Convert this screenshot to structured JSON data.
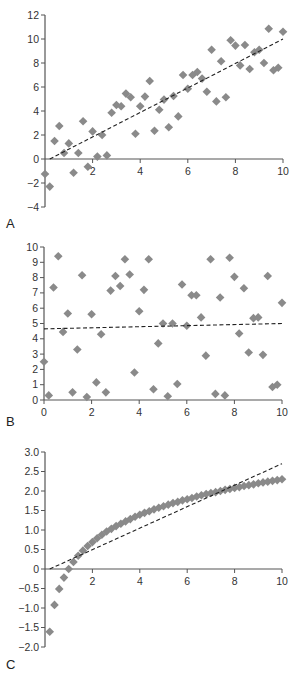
{
  "figure": {
    "marker_color": "#8a8a8a",
    "axis_color": "#555555",
    "fit_line_color": "#222222",
    "text_color": "#333333"
  },
  "chart_data": [
    {
      "panel": "A",
      "type": "scatter",
      "title": "",
      "xlabel": "",
      "ylabel": "",
      "xlim": [
        0,
        10
      ],
      "ylim": [
        -4,
        12
      ],
      "x_ticks": [
        2,
        4,
        6,
        8,
        10
      ],
      "y_ticks": [
        -4,
        -2,
        0,
        2,
        4,
        6,
        8,
        10,
        12
      ],
      "x_tick_labels": [
        "2",
        "4",
        "6",
        "8",
        "10"
      ],
      "y_tick_labels": [
        "-4",
        "-2",
        "0",
        "2",
        "4",
        "6",
        "8",
        "10",
        "12"
      ],
      "x_axis_at_y": 0,
      "grid": false,
      "legend": null,
      "marker": "diamond",
      "series": [
        {
          "name": "data",
          "x": [
            0,
            0.2,
            0.4,
            0.6,
            0.8,
            1,
            1.2,
            1.4,
            1.6,
            1.8,
            2,
            2.2,
            2.4,
            2.6,
            2.8,
            3,
            3.2,
            3.4,
            3.6,
            3.8,
            4,
            4.2,
            4.4,
            4.6,
            4.8,
            5,
            5.2,
            5.4,
            5.6,
            5.8,
            6,
            6.2,
            6.4,
            6.6,
            6.8,
            7,
            7.2,
            7.4,
            7.6,
            7.8,
            8,
            8.2,
            8.4,
            8.6,
            8.8,
            9,
            9.2,
            9.4,
            9.6,
            9.8,
            10
          ],
          "y": [
            -1.25,
            -2.3,
            1.5,
            2.75,
            0.5,
            1.3,
            -1.15,
            0.5,
            3.15,
            -0.65,
            2.3,
            0.2,
            2,
            0.3,
            3.85,
            4.5,
            4.4,
            5.45,
            5.15,
            2.1,
            4.4,
            5.2,
            6.5,
            2.35,
            4.1,
            4.95,
            2.65,
            5.25,
            3.55,
            7,
            5.85,
            7,
            7.25,
            6.7,
            5.6,
            9.1,
            4.8,
            8.15,
            5.15,
            9.9,
            9.45,
            7.8,
            9.5,
            7.5,
            8.9,
            9.1,
            8,
            10.85,
            7.4,
            7.6,
            10.6
          ]
        }
      ],
      "fit_line": {
        "style": "dashed",
        "x": [
          0.2,
          10
        ],
        "y": [
          0,
          10
        ]
      }
    },
    {
      "panel": "B",
      "type": "scatter",
      "title": "",
      "xlabel": "",
      "ylabel": "",
      "xlim": [
        0,
        10
      ],
      "ylim": [
        0,
        10
      ],
      "x_ticks": [
        0,
        2,
        4,
        6,
        8,
        10
      ],
      "y_ticks": [
        0,
        1,
        2,
        3,
        4,
        5,
        6,
        7,
        8,
        9,
        10
      ],
      "x_tick_labels": [
        "0",
        "2",
        "4",
        "6",
        "8",
        "10"
      ],
      "y_tick_labels": [
        "0",
        "1",
        "2",
        "3",
        "4",
        "5",
        "6",
        "7",
        "8",
        "9",
        "10"
      ],
      "x_axis_at_y": 0,
      "grid": false,
      "legend": null,
      "marker": "diamond",
      "series": [
        {
          "name": "data",
          "x": [
            0,
            0.2,
            0.4,
            0.6,
            0.8,
            1,
            1.2,
            1.4,
            1.6,
            1.8,
            2,
            2.2,
            2.4,
            2.6,
            2.8,
            3,
            3.2,
            3.4,
            3.6,
            3.8,
            4,
            4.2,
            4.4,
            4.6,
            4.8,
            5,
            5.2,
            5.4,
            5.6,
            5.8,
            6,
            6.2,
            6.4,
            6.6,
            6.8,
            7,
            7.2,
            7.4,
            7.6,
            7.8,
            8,
            8.2,
            8.4,
            8.6,
            8.8,
            9,
            9.2,
            9.4,
            9.6,
            9.8,
            10
          ],
          "y": [
            2.5,
            0.3,
            7.35,
            9.4,
            4.45,
            5.65,
            0.5,
            3.3,
            8.15,
            0.2,
            5.6,
            1.15,
            4.3,
            0.5,
            7.15,
            8.1,
            7.45,
            9.2,
            8.2,
            1.8,
            5.8,
            7.2,
            9.2,
            0.7,
            3.7,
            5,
            0.25,
            5,
            1.05,
            7.55,
            4.85,
            6.85,
            6.85,
            5.4,
            2.9,
            9.2,
            0.4,
            6.7,
            0.3,
            9.3,
            8.05,
            4.35,
            7.3,
            3.1,
            5.35,
            5.4,
            2.95,
            8.1,
            0.85,
            1,
            6.35
          ]
        }
      ],
      "fit_line": {
        "style": "dashed",
        "x": [
          0,
          10
        ],
        "y": [
          4.65,
          5.0
        ]
      }
    },
    {
      "panel": "C",
      "type": "scatter",
      "title": "",
      "xlabel": "",
      "ylabel": "",
      "xlim": [
        0,
        10
      ],
      "ylim": [
        -2.0,
        3.0
      ],
      "x_ticks": [
        2,
        4,
        6,
        8,
        10
      ],
      "y_ticks": [
        -2.0,
        -1.5,
        -1.0,
        -0.5,
        0,
        0.5,
        1.0,
        1.5,
        2.0,
        2.5,
        3.0
      ],
      "x_tick_labels": [
        "2",
        "4",
        "6",
        "8",
        "10"
      ],
      "y_tick_labels": [
        "-2.0",
        "-1.5",
        "-1.0",
        "-0.5",
        "0",
        "0.5",
        "1.0",
        "1.5",
        "2.0",
        "2.5",
        "3.0"
      ],
      "x_axis_at_y": 0,
      "grid": false,
      "legend": null,
      "marker": "diamond",
      "series": [
        {
          "name": "data (y = ln x)",
          "x": [
            0.2,
            0.4,
            0.6,
            0.8,
            1,
            1.2,
            1.4,
            1.6,
            1.8,
            2,
            2.2,
            2.4,
            2.6,
            2.8,
            3,
            3.2,
            3.4,
            3.6,
            3.8,
            4,
            4.2,
            4.4,
            4.6,
            4.8,
            5,
            5.2,
            5.4,
            5.6,
            5.8,
            6,
            6.2,
            6.4,
            6.6,
            6.8,
            7,
            7.2,
            7.4,
            7.6,
            7.8,
            8,
            8.2,
            8.4,
            8.6,
            8.8,
            9,
            9.2,
            9.4,
            9.6,
            9.8,
            10
          ],
          "y": [
            -1.61,
            -0.92,
            -0.51,
            -0.22,
            0,
            0.18,
            0.34,
            0.47,
            0.59,
            0.69,
            0.79,
            0.88,
            0.96,
            1.03,
            1.1,
            1.16,
            1.22,
            1.28,
            1.34,
            1.39,
            1.44,
            1.48,
            1.53,
            1.57,
            1.61,
            1.65,
            1.69,
            1.72,
            1.76,
            1.79,
            1.82,
            1.86,
            1.89,
            1.92,
            1.95,
            1.97,
            2,
            2.03,
            2.05,
            2.08,
            2.1,
            2.13,
            2.15,
            2.17,
            2.2,
            2.22,
            2.24,
            2.26,
            2.28,
            2.3
          ]
        }
      ],
      "fit_line": {
        "style": "dashed",
        "x": [
          0.2,
          10
        ],
        "y": [
          0,
          2.7
        ]
      }
    }
  ]
}
